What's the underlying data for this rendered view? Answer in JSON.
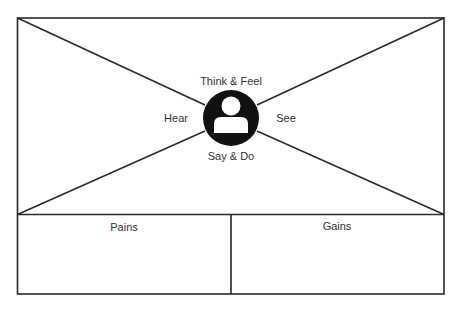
{
  "diagram": {
    "type": "empathy-map",
    "colors": {
      "stroke": "#2a2a2a",
      "icon_fill": "#111111",
      "icon_glyph": "#ffffff",
      "text": "#333333",
      "background": "#ffffff"
    },
    "quadrants": {
      "top": "Think & Feel",
      "left": "Hear",
      "right": "See",
      "bottom": "Say & Do"
    },
    "center_icon": "user-persona-icon",
    "bottom_panels": [
      {
        "label": "Pains"
      },
      {
        "label": "Gains"
      }
    ]
  }
}
